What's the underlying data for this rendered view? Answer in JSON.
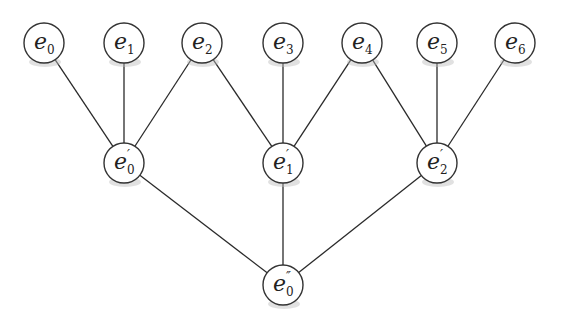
{
  "diagram": {
    "type": "tree",
    "node_radius": 20,
    "nodes": [
      {
        "id": "e0",
        "base": "e",
        "sub": "0",
        "sup": "",
        "x": 44,
        "y": 43
      },
      {
        "id": "e1",
        "base": "e",
        "sub": "1",
        "sup": "",
        "x": 124,
        "y": 43
      },
      {
        "id": "e2",
        "base": "e",
        "sub": "2",
        "sup": "",
        "x": 202,
        "y": 43
      },
      {
        "id": "e3",
        "base": "e",
        "sub": "3",
        "sup": "",
        "x": 283,
        "y": 43
      },
      {
        "id": "e4",
        "base": "e",
        "sub": "4",
        "sup": "",
        "x": 362,
        "y": 43
      },
      {
        "id": "e5",
        "base": "e",
        "sub": "5",
        "sup": "",
        "x": 437,
        "y": 43
      },
      {
        "id": "e6",
        "base": "e",
        "sub": "6",
        "sup": "",
        "x": 515,
        "y": 43
      },
      {
        "id": "e0p",
        "base": "e",
        "sub": "0",
        "sup": "′",
        "x": 124,
        "y": 163
      },
      {
        "id": "e1p",
        "base": "e",
        "sub": "1",
        "sup": "′",
        "x": 283,
        "y": 163
      },
      {
        "id": "e2p",
        "base": "e",
        "sub": "2",
        "sup": "′",
        "x": 437,
        "y": 163
      },
      {
        "id": "e0pp",
        "base": "e",
        "sub": "0",
        "sup": "″",
        "x": 283,
        "y": 285
      }
    ],
    "edges": [
      [
        "e0",
        "e0p"
      ],
      [
        "e1",
        "e0p"
      ],
      [
        "e2",
        "e0p"
      ],
      [
        "e2",
        "e1p"
      ],
      [
        "e3",
        "e1p"
      ],
      [
        "e4",
        "e1p"
      ],
      [
        "e4",
        "e2p"
      ],
      [
        "e5",
        "e2p"
      ],
      [
        "e6",
        "e2p"
      ],
      [
        "e0p",
        "e0pp"
      ],
      [
        "e1p",
        "e0pp"
      ],
      [
        "e2p",
        "e0pp"
      ]
    ]
  }
}
